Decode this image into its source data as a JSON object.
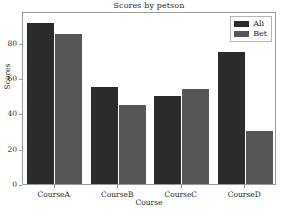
{
  "chart_data": {
    "type": "bar",
    "title": "Scores by petson",
    "xlabel": "Course",
    "ylabel": "Scores",
    "categories": [
      "CourseA",
      "CourseB",
      "CourseC",
      "CourseD"
    ],
    "series": [
      {
        "name": "Ali",
        "color": "#2b2b2b",
        "values": [
          91,
          55,
          50,
          75
        ]
      },
      {
        "name": "Bet",
        "color": "#565656",
        "values": [
          85,
          45,
          54,
          30
        ]
      }
    ],
    "ylim": [
      0,
      98
    ],
    "yticks": [
      0,
      20,
      40,
      60,
      80
    ],
    "ytick_labels": [
      "0",
      "20",
      "40",
      "60",
      "80"
    ],
    "grid": false,
    "legend_position": "upper right"
  }
}
